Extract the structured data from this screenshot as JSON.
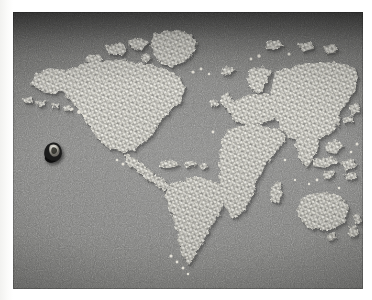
{
  "image": {
    "kind": "photograph",
    "subject": "world-map-made-of-small-white-tablets",
    "caption": "Photograph of a world map formed from thousands of small white pill-like objects arranged on a dark grey textured board, with a single small dark object placed in the eastern Pacific Ocean.",
    "orientation": "landscape",
    "has_visible_text": false,
    "frame": {
      "page_background": "#ffffff",
      "print_left": 13,
      "print_top": 12,
      "print_width": 350,
      "print_height": 277
    }
  },
  "palette": {
    "page": "#ffffff",
    "board_dark": "#5f5f5e",
    "board_mid": "#84847f",
    "board_light": "#949491",
    "tablet_white": "#f0efe8",
    "tablet_shadow": "#8e8d86",
    "object_dark": "#18181a",
    "object_highlight": "#e9e8e2"
  },
  "scene": {
    "background_label": "textured grey board",
    "landmass_material": "small white tablets",
    "landmass_label": "world map landmasses",
    "object_label": "small dark object in eastern Pacific"
  },
  "landmasses": [
    {
      "name": "north-america",
      "label": "North America"
    },
    {
      "name": "greenland",
      "label": "Greenland"
    },
    {
      "name": "arctic-islands",
      "label": "Canadian Arctic islands"
    },
    {
      "name": "alaska",
      "label": "Alaska"
    },
    {
      "name": "aleutian-chain",
      "label": "Aleutian Islands"
    },
    {
      "name": "central-america",
      "label": "Central America"
    },
    {
      "name": "caribbean",
      "label": "Caribbean islands"
    },
    {
      "name": "south-america",
      "label": "South America"
    },
    {
      "name": "europe",
      "label": "Europe"
    },
    {
      "name": "british-isles",
      "label": "British Isles"
    },
    {
      "name": "scandinavia",
      "label": "Scandinavia"
    },
    {
      "name": "iceland",
      "label": "Iceland"
    },
    {
      "name": "africa",
      "label": "Africa"
    },
    {
      "name": "madagascar",
      "label": "Madagascar"
    },
    {
      "name": "asia",
      "label": "Asia"
    },
    {
      "name": "india",
      "label": "Indian subcontinent"
    },
    {
      "name": "arabia",
      "label": "Arabian peninsula"
    },
    {
      "name": "japan",
      "label": "Japan"
    },
    {
      "name": "southeast-asia",
      "label": "Southeast Asian islands"
    },
    {
      "name": "australia",
      "label": "Australia"
    },
    {
      "name": "new-zealand",
      "label": "New Zealand"
    },
    {
      "name": "svalbard",
      "label": "Arctic archipelago"
    }
  ]
}
